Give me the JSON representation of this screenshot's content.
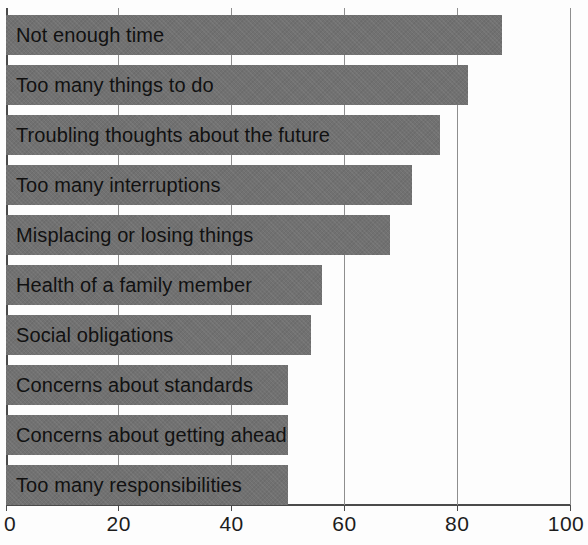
{
  "chart_data": {
    "type": "bar",
    "orientation": "horizontal",
    "title": "",
    "xlabel": "",
    "ylabel": "",
    "xlim": [
      0,
      100
    ],
    "xticks": [
      0,
      20,
      40,
      60,
      80,
      100
    ],
    "xtick_labels": [
      "0",
      "20",
      "40",
      "60",
      "80",
      "100"
    ],
    "grid": true,
    "legend": "none",
    "bar_color": "#717171",
    "categories": [
      "Not enough time",
      "Too many things to do",
      "Troubling thoughts about the future",
      "Too many interruptions",
      "Misplacing or losing things",
      "Health of a family member",
      "Social obligations",
      "Concerns about standards",
      "Concerns about getting ahead",
      "Too many responsibilities"
    ],
    "values": [
      88,
      82,
      77,
      72,
      68,
      56,
      54,
      50,
      50,
      50
    ]
  },
  "ticks": [
    {
      "label": "0",
      "value": 0
    },
    {
      "label": "20",
      "value": 20
    },
    {
      "label": "40",
      "value": 40
    },
    {
      "label": "60",
      "value": 60
    },
    {
      "label": "80",
      "value": 80
    },
    {
      "label": "100",
      "value": 100
    }
  ],
  "bars": [
    {
      "label": "Not enough time",
      "value": 88
    },
    {
      "label": "Too many things to do",
      "value": 82
    },
    {
      "label": "Troubling thoughts about the future",
      "value": 77
    },
    {
      "label": "Too many interruptions",
      "value": 72
    },
    {
      "label": "Misplacing or losing things",
      "value": 68
    },
    {
      "label": "Health of a family member",
      "value": 56
    },
    {
      "label": "Social obligations",
      "value": 54
    },
    {
      "label": "Concerns about standards",
      "value": 50
    },
    {
      "label": "Concerns about getting ahead",
      "value": 50
    },
    {
      "label": "Too many responsibilities",
      "value": 50
    }
  ]
}
